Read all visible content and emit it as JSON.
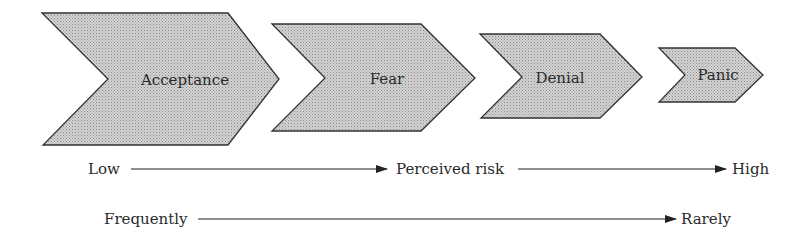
{
  "diagram": {
    "stages": [
      {
        "label": "Acceptance"
      },
      {
        "label": "Fear"
      },
      {
        "label": "Denial"
      },
      {
        "label": "Panic"
      }
    ],
    "scales": [
      {
        "name": "Perceived risk",
        "start": "Low",
        "middle": "Perceived risk",
        "end": "High"
      },
      {
        "name": "Frequency",
        "start": "Frequently",
        "end": "Rarely"
      }
    ],
    "colors": {
      "fill": "#c9c9c9",
      "stroke": "#333333",
      "text": "#2a2a2a"
    }
  }
}
